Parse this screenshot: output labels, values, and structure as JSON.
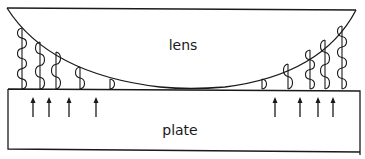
{
  "diagram": {
    "labels": {
      "lens": "lens",
      "plate": "plate"
    },
    "standing_waves": {
      "left_count": 5,
      "right_count": 5
    },
    "arrows": {
      "left_count": 4,
      "right_count": 4,
      "direction": "up"
    }
  }
}
